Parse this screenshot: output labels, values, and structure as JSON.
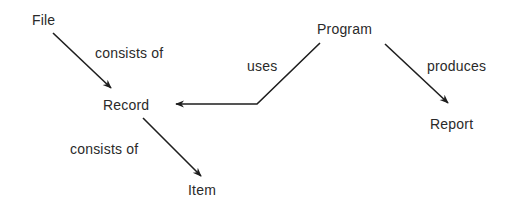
{
  "diagram": {
    "nodes": [
      {
        "id": "file",
        "label": "File"
      },
      {
        "id": "program",
        "label": "Program"
      },
      {
        "id": "record",
        "label": "Record"
      },
      {
        "id": "report",
        "label": "Report"
      },
      {
        "id": "item",
        "label": "Item"
      }
    ],
    "edges": [
      {
        "from": "File",
        "to": "Record",
        "label": "consists of"
      },
      {
        "from": "Program",
        "to": "Record",
        "label": "uses"
      },
      {
        "from": "Program",
        "to": "Report",
        "label": "produces"
      },
      {
        "from": "Record",
        "to": "Item",
        "label": "consists of"
      }
    ],
    "colors": {
      "line": "#1e1e1e",
      "text": "#2a2a2a",
      "background": "#ffffff"
    }
  }
}
